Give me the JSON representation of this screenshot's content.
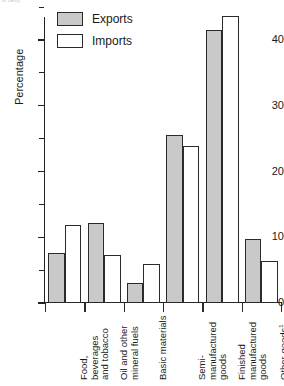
{
  "top_fragment": "in cent)",
  "chart_data": {
    "type": "bar",
    "title": "",
    "xlabel": "",
    "ylabel": "Percentage",
    "ylim": [
      0,
      46
    ],
    "yticks": [
      0,
      10,
      20,
      30,
      40
    ],
    "yticklabels": [
      "0",
      "10",
      "20",
      "30",
      "40"
    ],
    "yminorticks": [
      5,
      15,
      25,
      35,
      45
    ],
    "grid": false,
    "legend_position": "top-left",
    "categories": [
      "Food, beverages\nand tobacco",
      "Oil and other\nmineral fuels",
      "Basic materials",
      "Semi-\nmanufactured\ngoods",
      "Finished\nmanufactured\ngoods",
      "Other goods"
    ],
    "category_footnotes": [
      "",
      "",
      "",
      "",
      "",
      "1"
    ],
    "series": [
      {
        "name": "Exports",
        "color": "#c9c9c9",
        "values": [
          7.6,
          12.1,
          3.0,
          25.6,
          41.5,
          9.7
        ]
      },
      {
        "name": "Imports",
        "color": "#ffffff",
        "values": [
          11.9,
          7.3,
          5.9,
          23.9,
          43.6,
          6.4
        ]
      }
    ]
  },
  "legend": {
    "items": [
      {
        "label": "Exports",
        "style": "exports"
      },
      {
        "label": "Imports",
        "style": "imports"
      }
    ]
  }
}
